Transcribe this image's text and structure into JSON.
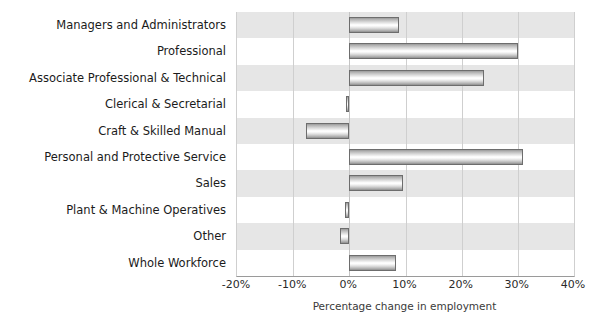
{
  "title_sliver": "",
  "chart_data": {
    "type": "bar",
    "orientation": "horizontal",
    "title": "",
    "xlabel": "Percentage change in employment",
    "ylabel": "",
    "xlim": [
      -20,
      40
    ],
    "xticks": [
      -20,
      -10,
      0,
      10,
      20,
      30,
      40
    ],
    "xtick_labels": [
      "-20%",
      "-10%",
      "0%",
      "10%",
      "20%",
      "30%",
      "40%"
    ],
    "grid": true,
    "legend": null,
    "categories": [
      "Managers and Administrators",
      "Professional",
      "Associate Professional & Technical",
      "Clerical & Secretarial",
      "Craft & Skilled Manual",
      "Personal and Protective Service",
      "Sales",
      "Plant & Machine Operatives",
      "Other",
      "Whole Workforce"
    ],
    "values": [
      8.8,
      30.0,
      24.0,
      -0.6,
      -7.8,
      30.9,
      9.5,
      -0.7,
      -1.6,
      8.3
    ],
    "colors": {
      "bar_fill_light": "#fdfdfd",
      "bar_fill_dark": "#8f8f8f",
      "bar_border": "#6d6d6d",
      "band_shaded": "#e6e6e6",
      "band_plain": "#ffffff",
      "gridline": "#cfcfcf",
      "axis": "#9a9a9a",
      "text": "#1b1b1b"
    }
  }
}
